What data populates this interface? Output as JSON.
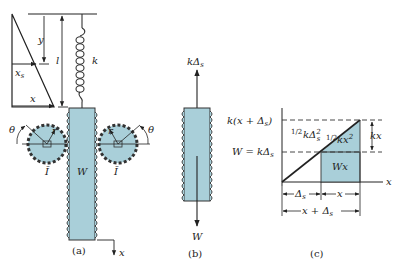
{
  "colors": {
    "fill": "#a9cfd9",
    "stroke": "#333333",
    "background": "#ffffff"
  },
  "panel_a": {
    "caption": "(a)",
    "labels": {
      "y": "y",
      "l": "l",
      "k": "k",
      "xs": "x",
      "xs_sub": "s",
      "x_triangle": "x",
      "theta_left": "θ",
      "theta_right": "θ",
      "r_left": "r",
      "r_right": "r",
      "W": "W",
      "I_left": "Ī",
      "I_right": "Ī",
      "x_axis": "x"
    }
  },
  "panel_b": {
    "caption": "(b)",
    "labels": {
      "top_force": "kΔ",
      "top_force_sub": "s",
      "bottom_force": "W"
    }
  },
  "panel_c": {
    "caption": "(c)",
    "labels": {
      "top_level": "k(x + Δ",
      "top_level_sub": "s",
      "top_level_end": ")",
      "mid_level": "W = kΔ",
      "mid_level_sub": "s",
      "half_kds2_frac": "1/2",
      "half_kds2": "kΔ",
      "half_kds2_sub": "s",
      "half_kds2_sup": "2",
      "half_kx2_frac": "1/2",
      "half_kx2": "kx",
      "half_kx2_sup": "2",
      "kx": "kx",
      "Wx": "Wx",
      "x_axis": "x",
      "dim_ds": "Δ",
      "dim_ds_sub": "s",
      "dim_x": "x",
      "dim_total": "x + Δ",
      "dim_total_sub": "s"
    }
  }
}
